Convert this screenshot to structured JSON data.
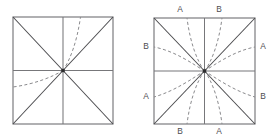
{
  "figure": {
    "caption": "",
    "background_color": "#ffffff",
    "line_color": "#77777a",
    "diagonal_color": "#4a4a4d",
    "dash_color": "#8a8a8d",
    "label_color": "#4d4d50"
  },
  "chart_data": {
    "type": "diagram",
    "title": "",
    "xlabel": "",
    "ylabel": "",
    "grid": false,
    "legend_position": "none",
    "panels": [
      {
        "panel_id": "left",
        "name": "left-square-diagram",
        "square": {
          "x0": 13,
          "y0": 17,
          "x1": 113,
          "y1": 124
        },
        "center": {
          "x": 63,
          "y": 70.5
        },
        "has_midlines": true,
        "has_diagonals": true,
        "labels": [],
        "curves": [
          {
            "curve_id": "L-steep-ur",
            "family": "steep",
            "quadrant": "upper-right",
            "from": "center",
            "to": "top-edge",
            "path": "M 63 70.5 C 70 60 77 42 80.5 17"
          },
          {
            "curve_id": "L-flat-ll",
            "family": "flat",
            "quadrant": "lower-left",
            "from": "center",
            "to": "left-edge",
            "path": "M 63 70.5 C 52 77 35 84 13 87"
          }
        ]
      },
      {
        "panel_id": "right",
        "name": "right-square-diagram",
        "square": {
          "x0": 154,
          "y0": 18,
          "x1": 255,
          "y1": 124
        },
        "center": {
          "x": 204.5,
          "y": 71
        },
        "has_midlines": true,
        "has_diagonals": true,
        "labels": [
          {
            "text": "A",
            "edge": "top",
            "position": "left-of-center",
            "x": 180,
            "y": 10
          },
          {
            "text": "B",
            "edge": "top",
            "position": "right-of-center",
            "x": 219,
            "y": 10
          },
          {
            "text": "B",
            "edge": "bottom",
            "position": "left-of-center",
            "x": 180,
            "y": 132
          },
          {
            "text": "A",
            "edge": "bottom",
            "position": "right-of-center",
            "x": 219,
            "y": 132
          },
          {
            "text": "B",
            "edge": "left",
            "position": "above-center",
            "x": 146,
            "y": 47
          },
          {
            "text": "A",
            "edge": "left",
            "position": "below-center",
            "x": 146,
            "y": 97
          },
          {
            "text": "A",
            "edge": "right",
            "position": "above-center",
            "x": 263,
            "y": 47
          },
          {
            "text": "B",
            "edge": "right",
            "position": "below-center",
            "x": 263,
            "y": 97
          }
        ],
        "curves": [
          {
            "curve_id": "R-steep-ur",
            "family": "steep",
            "quadrant": "upper-right",
            "from": "center",
            "to": "top-edge",
            "label": "B",
            "path": "M 204.5 71 C 212 61 219 42 222 18"
          },
          {
            "curve_id": "R-flat-ur",
            "family": "flat",
            "quadrant": "upper-right",
            "from": "center",
            "to": "right-edge",
            "label": "A",
            "path": "M 204.5 71 C 216 64 234 51 255 47"
          },
          {
            "curve_id": "R-steep-ul",
            "family": "steep",
            "quadrant": "upper-left",
            "from": "center",
            "to": "top-edge",
            "label": "A",
            "path": "M 204.5 71 C 197 61 190 42 187 18"
          },
          {
            "curve_id": "R-flat-ul",
            "family": "flat",
            "quadrant": "upper-left",
            "from": "center",
            "to": "left-edge",
            "label": "B",
            "path": "M 204.5 71 C 193 64 175 51 154 47"
          },
          {
            "curve_id": "R-steep-ll",
            "family": "steep",
            "quadrant": "lower-left",
            "from": "center",
            "to": "bottom-edge",
            "label": "B",
            "path": "M 204.5 71 C 197 81 190 100 187 124"
          },
          {
            "curve_id": "R-flat-ll",
            "family": "flat",
            "quadrant": "lower-left",
            "from": "center",
            "to": "left-edge",
            "label": "A",
            "path": "M 204.5 71 C 193 78 175 91 154 97"
          },
          {
            "curve_id": "R-steep-lr",
            "family": "steep",
            "quadrant": "lower-right",
            "from": "center",
            "to": "bottom-edge",
            "label": "A",
            "path": "M 204.5 71 C 212 81 219 100 222 124"
          },
          {
            "curve_id": "R-flat-lr",
            "family": "flat",
            "quadrant": "lower-right",
            "from": "center",
            "to": "right-edge",
            "label": "B",
            "path": "M 204.5 71 C 216 78 234 91 255 97"
          }
        ]
      }
    ]
  }
}
